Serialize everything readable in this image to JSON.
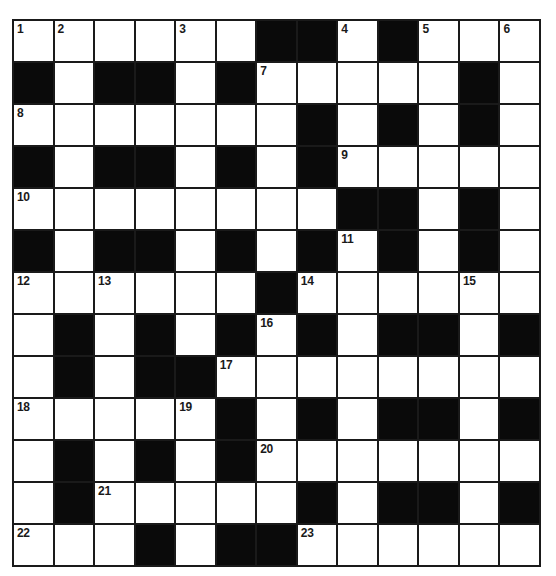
{
  "puzzle": {
    "type": "crossword",
    "rows": 13,
    "cols": 13,
    "colors": {
      "block": "#0a0a0a",
      "cell": "#ffffff",
      "line": "#1a1a1a",
      "number": "#1a1a1a"
    },
    "grid": [
      [
        "1",
        "2",
        ".",
        ".",
        "3",
        ".",
        "#",
        "#",
        "4",
        "#",
        "5",
        ".",
        "6"
      ],
      [
        "#",
        ".",
        "#",
        "#",
        ".",
        "#",
        "7",
        ".",
        ".",
        ".",
        ".",
        "#",
        "."
      ],
      [
        "8",
        ".",
        ".",
        ".",
        ".",
        ".",
        ".",
        "#",
        ".",
        "#",
        ".",
        "#",
        "."
      ],
      [
        "#",
        ".",
        "#",
        "#",
        ".",
        "#",
        ".",
        "#",
        "9",
        ".",
        ".",
        ".",
        "."
      ],
      [
        "10",
        ".",
        ".",
        ".",
        ".",
        ".",
        ".",
        ".",
        "#",
        "#",
        ".",
        "#",
        "."
      ],
      [
        "#",
        ".",
        "#",
        "#",
        ".",
        "#",
        ".",
        "#",
        "11",
        "#",
        ".",
        "#",
        "."
      ],
      [
        "12",
        ".",
        "13",
        ".",
        ".",
        ".",
        "#",
        "14",
        ".",
        ".",
        ".",
        "15",
        "."
      ],
      [
        ".",
        "#",
        ".",
        "#",
        ".",
        "#",
        "16",
        "#",
        ".",
        "#",
        "#",
        ".",
        "#"
      ],
      [
        ".",
        "#",
        ".",
        "#",
        "#",
        "17",
        ".",
        ".",
        ".",
        ".",
        ".",
        ".",
        "."
      ],
      [
        "18",
        ".",
        ".",
        ".",
        "19",
        "#",
        ".",
        "#",
        ".",
        "#",
        "#",
        ".",
        "#"
      ],
      [
        ".",
        "#",
        ".",
        "#",
        ".",
        "#",
        "20",
        ".",
        ".",
        ".",
        ".",
        ".",
        "."
      ],
      [
        ".",
        "#",
        "21",
        ".",
        ".",
        ".",
        ".",
        "#",
        ".",
        "#",
        "#",
        ".",
        "#"
      ],
      [
        "22",
        ".",
        ".",
        "#",
        ".",
        "#",
        "#",
        "23",
        ".",
        ".",
        ".",
        ".",
        "."
      ]
    ],
    "clue_numbers": [
      "1",
      "2",
      "3",
      "4",
      "5",
      "6",
      "7",
      "8",
      "9",
      "10",
      "11",
      "12",
      "13",
      "14",
      "15",
      "16",
      "17",
      "18",
      "19",
      "20",
      "21",
      "22",
      "23"
    ]
  }
}
